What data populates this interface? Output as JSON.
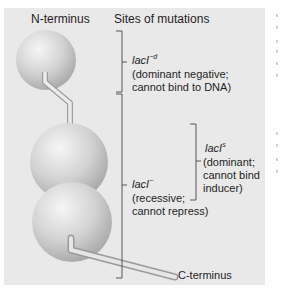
{
  "figure": {
    "headers": {
      "n_terminus": "N-terminus",
      "sites": "Sites of mutations",
      "c_terminus": "C-terminus"
    },
    "mutations": [
      {
        "gene": "lacI",
        "superscript": "−d",
        "line1": "(dominant negative;",
        "line2": "cannot bind to DNA)"
      },
      {
        "gene": "lacI",
        "superscript": "s",
        "line1": "(dominant;",
        "line2": "cannot bind",
        "line3": "inducer)"
      },
      {
        "gene": "lacI",
        "superscript": "−",
        "line1": "(recessive;",
        "line2": "cannot repress)"
      }
    ],
    "colors": {
      "panel_bg": "#e9e9e9",
      "sphere_light": "#f4f4f4",
      "sphere_dark": "#a9a9a9",
      "bracket": "#555555"
    }
  }
}
